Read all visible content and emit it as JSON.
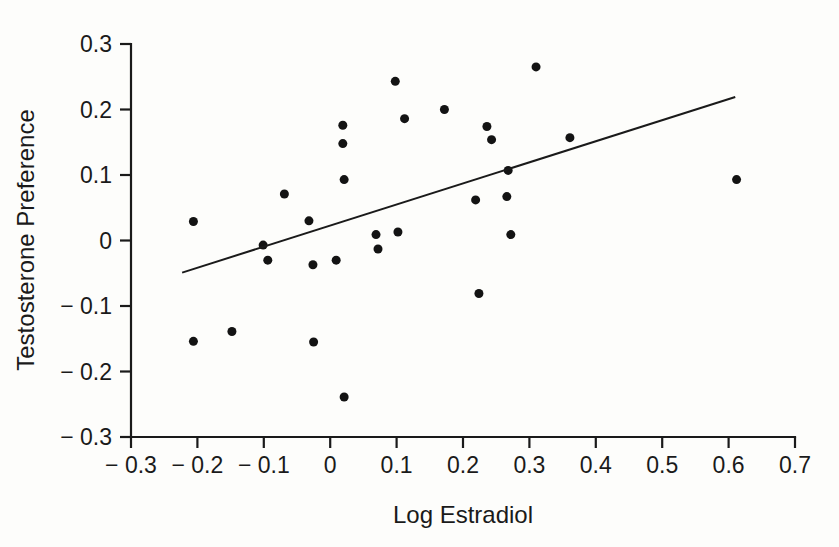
{
  "chart_data": {
    "type": "scatter",
    "title": "",
    "xlabel": "Log Estradiol",
    "ylabel": "Testosterone Preference",
    "xlim": [
      -0.3,
      0.7
    ],
    "ylim": [
      -0.3,
      0.3
    ],
    "grid": false,
    "legend": "none",
    "xticks": [
      -0.3,
      -0.2,
      -0.1,
      0,
      0.1,
      0.2,
      0.3,
      0.4,
      0.5,
      0.6,
      0.7
    ],
    "xticklabels": [
      "− 0.3",
      "− 0.2",
      "− 0.1",
      "0",
      "0.1",
      "0.2",
      "0.3",
      "0.4",
      "0.5",
      "0.6",
      "0.7"
    ],
    "yticks": [
      0.3,
      0.2,
      0.1,
      0,
      -0.1,
      -0.2,
      -0.3
    ],
    "yticklabels": [
      "0.3",
      "0.2",
      "0.1",
      "0",
      "− 0.1",
      "− 0.2",
      "− 0.3"
    ],
    "marker": "filled-circle",
    "marker_color": "#131313",
    "marker_size": 9,
    "points": [
      {
        "x": -0.206,
        "y": 0.029
      },
      {
        "x": -0.206,
        "y": -0.154
      },
      {
        "x": -0.148,
        "y": -0.139
      },
      {
        "x": -0.101,
        "y": -0.007
      },
      {
        "x": -0.094,
        "y": -0.03
      },
      {
        "x": -0.069,
        "y": 0.071
      },
      {
        "x": -0.032,
        "y": 0.03
      },
      {
        "x": -0.026,
        "y": -0.037
      },
      {
        "x": -0.025,
        "y": -0.155
      },
      {
        "x": 0.009,
        "y": -0.03
      },
      {
        "x": 0.019,
        "y": 0.176
      },
      {
        "x": 0.019,
        "y": 0.148
      },
      {
        "x": 0.021,
        "y": 0.093
      },
      {
        "x": 0.021,
        "y": -0.239
      },
      {
        "x": 0.069,
        "y": 0.009
      },
      {
        "x": 0.072,
        "y": -0.013
      },
      {
        "x": 0.098,
        "y": 0.243
      },
      {
        "x": 0.102,
        "y": 0.013
      },
      {
        "x": 0.112,
        "y": 0.186
      },
      {
        "x": 0.172,
        "y": 0.2
      },
      {
        "x": 0.219,
        "y": 0.062
      },
      {
        "x": 0.224,
        "y": -0.081
      },
      {
        "x": 0.236,
        "y": 0.174
      },
      {
        "x": 0.243,
        "y": 0.154
      },
      {
        "x": 0.266,
        "y": 0.067
      },
      {
        "x": 0.268,
        "y": 0.107
      },
      {
        "x": 0.272,
        "y": 0.009
      },
      {
        "x": 0.31,
        "y": 0.265
      },
      {
        "x": 0.361,
        "y": 0.157
      },
      {
        "x": 0.612,
        "y": 0.093
      }
    ],
    "trend_line": {
      "type": "linear-fit",
      "x_start": -0.223,
      "y_start": -0.049,
      "x_end": 0.61,
      "y_end": 0.219
    }
  }
}
